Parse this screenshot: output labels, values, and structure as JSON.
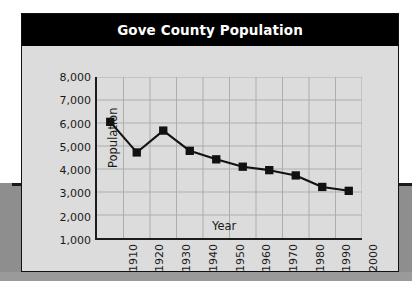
{
  "figure": {
    "title": "Gove County Population",
    "title_bar_color": "#000000",
    "title_text_color": "#ffffff",
    "panel_background": "#dcdcdc",
    "frame_color": "#111111",
    "backdrop_color": "#8e8e8e"
  },
  "chart_data": {
    "type": "line",
    "title": "Gove County Population",
    "xlabel": "Year",
    "ylabel": "Population",
    "xlim": [
      1900,
      2000
    ],
    "ylim": [
      1000,
      8000
    ],
    "grid": true,
    "legend": "none",
    "marker": "square",
    "marker_color": "#111111",
    "line_color": "#111111",
    "gridline_color": "#a9a9a9",
    "x_tick_labels": [
      "1910",
      "1920",
      "1930",
      "1940",
      "1950",
      "1960",
      "1970",
      "1980",
      "1990",
      "2000"
    ],
    "x_ticks": [
      1910,
      1920,
      1930,
      1940,
      1950,
      1960,
      1970,
      1980,
      1990,
      2000
    ],
    "y_tick_labels": [
      "8,000",
      "7,000",
      "6,000",
      "5,000",
      "4,000",
      "3,000",
      "2,000",
      "1,000"
    ],
    "y_ticks": [
      8000,
      7000,
      6000,
      5000,
      4000,
      3000,
      2000,
      1000
    ],
    "x": [
      1905,
      1915,
      1925,
      1935,
      1945,
      1955,
      1965,
      1975,
      1985,
      1995
    ],
    "values": [
      6050,
      4720,
      5670,
      4790,
      4420,
      4100,
      3950,
      3720,
      3220,
      3050
    ]
  }
}
